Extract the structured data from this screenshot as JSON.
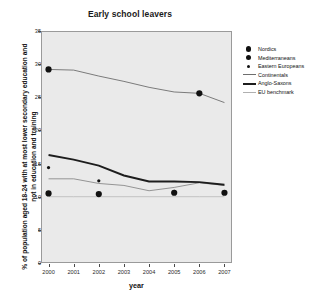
{
  "chart_data": {
    "type": "line",
    "title": "Early school leavers",
    "xlabel": "year",
    "ylabel": "% of population aged 18-24 with at most lower secondary education and not in education and training",
    "x": [
      2000,
      2001,
      2002,
      2003,
      2004,
      2005,
      2006,
      2007
    ],
    "xlim": [
      1999.7,
      2007.3
    ],
    "ylim": [
      0,
      35
    ],
    "yticks": [
      0,
      5,
      10,
      15,
      20,
      25,
      30,
      35
    ],
    "xticks": [
      "2000",
      "2001",
      "2002",
      "2003",
      "2004",
      "2005",
      "2006",
      "2007"
    ],
    "grid": false,
    "legend_position": "right",
    "series": [
      {
        "name": "Nordics",
        "marker": "circle-large",
        "line": "none",
        "color": "#111111",
        "values": [
          10.5,
          null,
          10.4,
          null,
          null,
          10.6,
          null,
          10.6
        ],
        "marker_years": [
          2000,
          2002,
          2005,
          2007
        ]
      },
      {
        "name": "Mediterraneans",
        "marker": "circle-large",
        "line": "solid-thin",
        "color": "#6e6e6e",
        "values": [
          29.2,
          29.1,
          28.2,
          27.4,
          26.5,
          25.8,
          25.6,
          24.2
        ],
        "marker_years": [
          2000,
          2006
        ]
      },
      {
        "name": "Eastern Europeans",
        "marker": "circle-small",
        "line": "none",
        "color": "#111111",
        "values": [
          14.4,
          null,
          12.4,
          null,
          null,
          10.8,
          null,
          null
        ],
        "marker_years": [
          2000,
          2002,
          2005
        ]
      },
      {
        "name": "Continentals",
        "marker": "none",
        "line": "solid-thin",
        "color": "#8a8a8a",
        "values": [
          12.7,
          12.7,
          12.0,
          11.7,
          10.9,
          11.4,
          12.1,
          11.7
        ]
      },
      {
        "name": "Anglo-Saxons",
        "marker": "none",
        "line": "solid-bold",
        "color": "#1d1d1d",
        "values": [
          16.3,
          15.6,
          14.7,
          13.2,
          12.3,
          12.3,
          12.2,
          11.8
        ]
      },
      {
        "name": "EU benchmark",
        "marker": "none",
        "line": "solid-thin",
        "color": "#bdbdbd",
        "values": [
          10.0,
          10.0,
          10.0,
          10.0,
          10.0,
          10.0,
          10.0,
          10.0
        ]
      }
    ]
  },
  "legend": {
    "items": [
      {
        "label": "Nordics",
        "key": "dot-large"
      },
      {
        "label": "Mediterraneans",
        "key": "dot-large"
      },
      {
        "label": "Eastern Europeans",
        "key": "dot-small"
      },
      {
        "label": "Continentals",
        "key": "line-thin"
      },
      {
        "label": "Anglo-Saxons",
        "key": "line-bold"
      },
      {
        "label": "EU benchmark",
        "key": "line-faint"
      }
    ]
  },
  "colors": {
    "plot_background": "#eaeaea",
    "page_background": "#ffffff",
    "axis": "#9a9a9a",
    "text": "#111111"
  }
}
